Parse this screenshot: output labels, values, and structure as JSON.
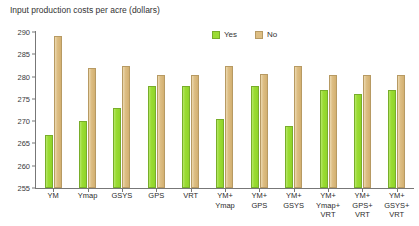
{
  "chart_data": {
    "type": "bar",
    "title": "Input production costs per acre (dollars)",
    "xlabel": "",
    "ylabel": "",
    "ylim": [
      255,
      290
    ],
    "yticks": [
      255,
      260,
      265,
      270,
      275,
      280,
      285,
      290
    ],
    "grid": false,
    "legend_position": "top-center",
    "categories": [
      "YM",
      "Ymap",
      "GSYS",
      "GPS",
      "VRT",
      "YM+\nYmap",
      "YM+\nGPS",
      "YM+\nGSYS",
      "YM+\nYmap+\nVRT",
      "YM+\nGPS+\nVRT",
      "YM+\nGSYS+\nVRT"
    ],
    "series": [
      {
        "name": "Yes",
        "color": "#9bdc33",
        "values": [
          267,
          270,
          273,
          278,
          278,
          270.5,
          278,
          269,
          277,
          276,
          277
        ]
      },
      {
        "name": "No",
        "color": "#ddbe84",
        "values": [
          289,
          282,
          282.3,
          280.3,
          280.3,
          282.3,
          280.5,
          282.3,
          280.3,
          280.3,
          280.3
        ]
      }
    ]
  },
  "legend": {
    "items": [
      {
        "label": "Yes",
        "color": "#9bdc33"
      },
      {
        "label": "No",
        "color": "#ddbe84"
      }
    ]
  }
}
